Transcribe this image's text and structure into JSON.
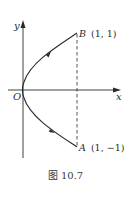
{
  "figure": {
    "caption": "图 10.7",
    "axes": {
      "x_label": "x",
      "y_label": "y",
      "origin_label": "O"
    },
    "points": [
      {
        "name": "B",
        "coords": "(1, 1)"
      },
      {
        "name": "A",
        "coords": "(1, −1)"
      }
    ],
    "curve": "parabola x = y², oriented from A(1, −1) through O to B(1, 1)",
    "dashed_segment": "AB vertical line x = 1",
    "colors": {
      "line": "#2a2a2a",
      "background": "#ffffff"
    }
  }
}
